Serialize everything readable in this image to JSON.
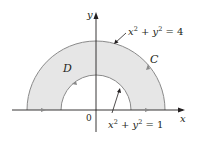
{
  "diagram": {
    "axis_x_label": "x",
    "axis_y_label": "y",
    "origin_label": "0",
    "region_label": "D",
    "curve_label": "C",
    "outer_eq": {
      "x": "x",
      "x_exp": "2",
      "plus": " + ",
      "y": "y",
      "y_exp": "2",
      "rhs": " = 4"
    },
    "inner_eq": {
      "x": "x",
      "x_exp": "2",
      "plus": " + ",
      "y": "y",
      "y_exp": "2",
      "rhs": " = 1"
    },
    "colors": {
      "region_fill": "#e6e6e6",
      "curve_stroke": "#8a8a8a",
      "axis": "#231f20",
      "arrow_marker": "#8a8a8a"
    }
  }
}
